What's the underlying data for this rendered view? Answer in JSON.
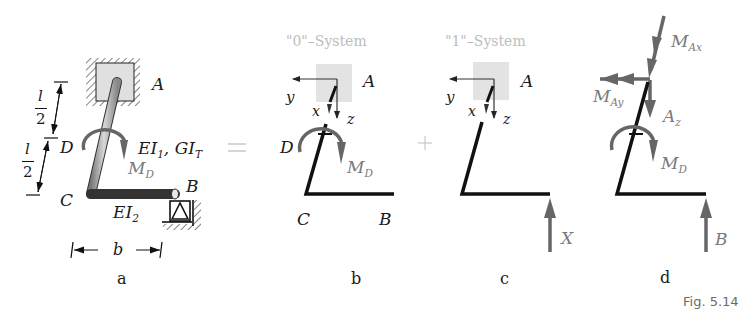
{
  "figure": {
    "caption": "Fig. 5.14",
    "operators": {
      "equals": "=",
      "plus": "+"
    }
  },
  "panel_a": {
    "label": "a",
    "points": {
      "A": "A",
      "B": "B",
      "C": "C",
      "D": "D"
    },
    "dimensions": {
      "half_length_num": "l",
      "half_length_den": "2",
      "width": "b"
    },
    "stiffness_upper": {
      "EI": "EI",
      "EI_sub": "1",
      "GI": ", GI",
      "GI_sub": "T"
    },
    "stiffness_lower": {
      "EI": "EI",
      "EI_sub": "2"
    },
    "moment": {
      "M": "M",
      "sub": "D"
    }
  },
  "panel_b": {
    "label": "b",
    "title": "\"0\"–System",
    "axes": {
      "x": "x",
      "y": "y",
      "z": "z"
    },
    "points": {
      "A": "A",
      "B": "B",
      "C": "C",
      "D": "D"
    },
    "moment": {
      "M": "M",
      "sub": "D"
    }
  },
  "panel_c": {
    "label": "c",
    "title": "\"1\"–System",
    "axes": {
      "x": "x",
      "y": "y",
      "z": "z"
    },
    "points": {
      "A": "A"
    },
    "force": "X"
  },
  "panel_d": {
    "label": "d",
    "reactions": {
      "MAx": {
        "M": "M",
        "sub": "Ax"
      },
      "MAy": {
        "M": "M",
        "sub": "Ay"
      },
      "Az": {
        "A": "A",
        "sub": "z"
      },
      "MD": {
        "M": "M",
        "sub": "D"
      },
      "B": "B"
    }
  },
  "colors": {
    "member": "#111111",
    "force_arrow": "#6b6b6b",
    "ground_box": "#e3e3e3",
    "faded_text": "#bdbdbd",
    "caption": "#6a6a6a"
  }
}
